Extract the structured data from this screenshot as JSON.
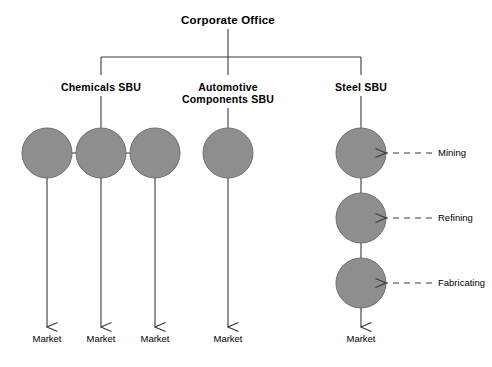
{
  "diagram": {
    "title": "Corporate Office",
    "root": {
      "label": "Corporate Office",
      "x": 228,
      "y": 14
    },
    "units": [
      {
        "name": "chemicals",
        "label_line1": "Chemicals SBU",
        "label_line2": "",
        "x": 101,
        "y": 82
      },
      {
        "name": "automotive",
        "label_line1": "Automotive",
        "label_line2": "Components SBU",
        "x": 228,
        "y": 82
      },
      {
        "name": "steel",
        "label_line1": "Steel SBU",
        "label_line2": "",
        "x": 361,
        "y": 82
      }
    ],
    "nodes": [
      {
        "name": "chemicals-node-1",
        "cx": 47,
        "cy": 153,
        "r": 25
      },
      {
        "name": "chemicals-node-2",
        "cx": 101,
        "cy": 153,
        "r": 25
      },
      {
        "name": "chemicals-node-3",
        "cx": 155,
        "cy": 153,
        "r": 25
      },
      {
        "name": "automotive-node-1",
        "cx": 228,
        "cy": 153,
        "r": 25
      },
      {
        "name": "steel-node-mining",
        "cx": 361,
        "cy": 153,
        "r": 25
      },
      {
        "name": "steel-node-refining",
        "cx": 361,
        "cy": 218,
        "r": 25
      },
      {
        "name": "steel-node-fabricating",
        "cx": 361,
        "cy": 283,
        "r": 25
      }
    ],
    "stage_labels": [
      {
        "name": "mining",
        "label": "Mining",
        "x": 438,
        "y": 148
      },
      {
        "name": "refining",
        "label": "Refining",
        "x": 438,
        "y": 213
      },
      {
        "name": "fabricating",
        "label": "Fabricating",
        "x": 438,
        "y": 278
      }
    ],
    "market_outputs": [
      {
        "name": "market-chemicals-1",
        "label": "Market",
        "x": 47,
        "y": 334
      },
      {
        "name": "market-chemicals-2",
        "label": "Market",
        "x": 101,
        "y": 334
      },
      {
        "name": "market-chemicals-3",
        "label": "Market",
        "x": 155,
        "y": 334
      },
      {
        "name": "market-automotive",
        "label": "Market",
        "x": 228,
        "y": 334
      },
      {
        "name": "market-steel",
        "label": "Market",
        "x": 361,
        "y": 334
      }
    ],
    "colors": {
      "node_fill": "#8e8e8e",
      "node_stroke": "#6e6e6e",
      "line": "#3a3a3a",
      "text": "#000000",
      "background": "#ffffff"
    }
  }
}
